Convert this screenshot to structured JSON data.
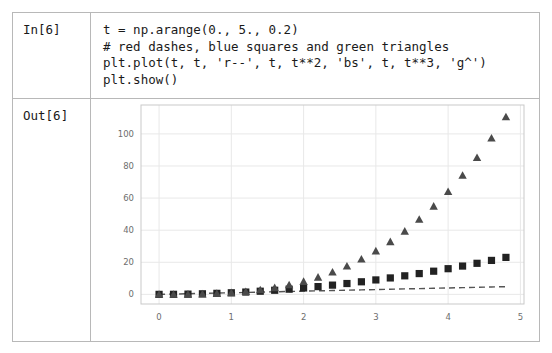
{
  "notebook": {
    "input_prompt": "In[6]",
    "output_prompt": "Out[6]",
    "code_lines": [
      "t = np.arange(0., 5., 0.2)",
      "# red dashes, blue squares and green triangles",
      "plt.plot(t, t, 'r--', t, t**2, 'bs', t, t**3, 'g^')",
      "plt.show()"
    ]
  },
  "colors": {
    "border": "#b8b8b8",
    "grid": "#e8e8e8",
    "axis": "#c9c9c9",
    "tick_label": "#6e6e6e",
    "dashes_series": "#555555",
    "squares_series": "#222222",
    "triangles_series": "#4a4a4a"
  },
  "chart_data": {
    "type": "scatter",
    "title": "",
    "xlabel": "",
    "ylabel": "",
    "xlim": [
      -0.25,
      5.05
    ],
    "ylim": [
      -6,
      118
    ],
    "xticks": [
      0,
      1,
      2,
      3,
      4,
      5
    ],
    "yticks": [
      0,
      20,
      40,
      60,
      80,
      100
    ],
    "xticklabels": [
      "0",
      "1",
      "2",
      "3",
      "4",
      "5"
    ],
    "yticklabels": [
      "0",
      "20",
      "40",
      "60",
      "80",
      "100"
    ],
    "grid": true,
    "legend": "none",
    "x": [
      0.0,
      0.2,
      0.4,
      0.6,
      0.8,
      1.0,
      1.2,
      1.4,
      1.6,
      1.8,
      2.0,
      2.2,
      2.4,
      2.6,
      2.8,
      3.0,
      3.2,
      3.4,
      3.6,
      3.8,
      4.0,
      4.2,
      4.4,
      4.6,
      4.8
    ],
    "series": [
      {
        "name": "t",
        "format": "r--",
        "style": "dashed-line",
        "color": "#555555",
        "values": [
          0.0,
          0.2,
          0.4,
          0.6,
          0.8,
          1.0,
          1.2,
          1.4,
          1.6,
          1.8,
          2.0,
          2.2,
          2.4,
          2.6,
          2.8,
          3.0,
          3.2,
          3.4,
          3.6,
          3.8,
          4.0,
          4.2,
          4.4,
          4.6,
          4.8
        ]
      },
      {
        "name": "t**2",
        "format": "bs",
        "style": "square-markers",
        "color": "#222222",
        "values": [
          0.0,
          0.04,
          0.16,
          0.36,
          0.64,
          1.0,
          1.44,
          1.96,
          2.56,
          3.24,
          4.0,
          4.84,
          5.76,
          6.76,
          7.84,
          9.0,
          10.24,
          11.56,
          12.96,
          14.44,
          16.0,
          17.64,
          19.36,
          21.16,
          23.04
        ]
      },
      {
        "name": "t**3",
        "format": "g^",
        "style": "triangle-markers",
        "color": "#4a4a4a",
        "values": [
          0.0,
          0.008,
          0.064,
          0.216,
          0.512,
          1.0,
          1.728,
          2.744,
          4.096,
          5.832,
          8.0,
          10.648,
          13.824,
          17.576,
          21.952,
          27.0,
          32.768,
          39.304,
          46.656,
          54.872,
          64.0,
          74.088,
          85.184,
          97.336,
          110.592
        ]
      }
    ]
  }
}
